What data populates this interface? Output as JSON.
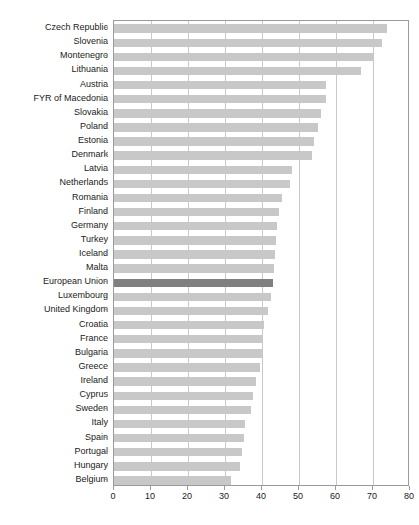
{
  "chart_data": {
    "type": "bar",
    "orientation": "horizontal",
    "title": "",
    "subtitle": "",
    "xlabel": "",
    "ylabel": "",
    "xlim": [
      0,
      80
    ],
    "ylim": null,
    "grid": "vertical",
    "legend": null,
    "xticks": [
      0,
      10,
      20,
      30,
      40,
      50,
      60,
      70,
      80
    ],
    "xtick_labels": [
      "0",
      "10",
      "20",
      "30",
      "40",
      "50",
      "60",
      "70",
      "80"
    ],
    "highlight_category": "European Union",
    "colors": {
      "bar": "#c8c8c8",
      "highlight_bar": "#808080",
      "grid": "#c9c9c9",
      "axis": "#9a9a9a",
      "text": "#1a1a1a",
      "background": "#ffffff"
    },
    "categories": [
      "Czech Republic",
      "Slovenia",
      "Montenegro",
      "Lithuania",
      "Austria",
      "FYR of Macedonia",
      "Slovakia",
      "Poland",
      "Estonia",
      "Denmark",
      "Latvia",
      "Netherlands",
      "Romania",
      "Finland",
      "Germany",
      "Turkey",
      "Iceland",
      "Malta",
      "European Union",
      "Luxembourg",
      "United Kingdom",
      "Croatia",
      "France",
      "Bulgaria",
      "Greece",
      "Ireland",
      "Cyprus",
      "Sweden",
      "Italy",
      "Spain",
      "Portugal",
      "Hungary",
      "Belgium"
    ],
    "values": [
      73.8,
      72.4,
      70.0,
      66.8,
      57.3,
      57.2,
      56.0,
      55.2,
      54.0,
      53.5,
      48.0,
      47.5,
      45.5,
      44.5,
      44.0,
      43.8,
      43.5,
      43.2,
      43.0,
      42.5,
      41.5,
      40.5,
      40.2,
      40.0,
      39.5,
      38.5,
      37.5,
      37.0,
      35.5,
      35.0,
      34.5,
      34.0,
      31.5
    ]
  }
}
